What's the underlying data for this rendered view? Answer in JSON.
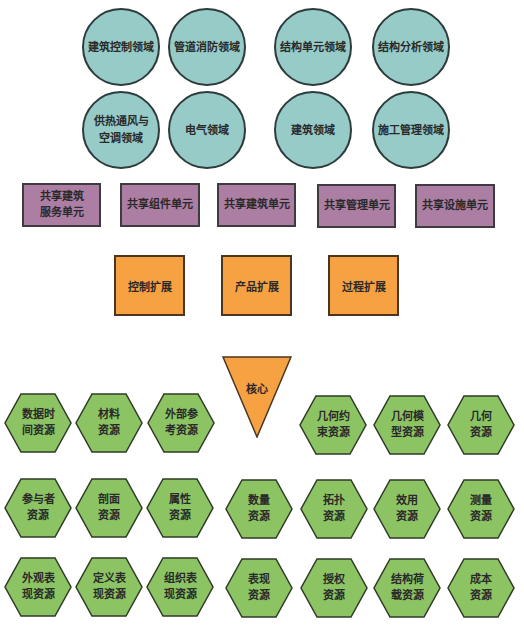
{
  "colors": {
    "domain_circle": "#97cbc8",
    "shared_unit_rect": "#ac7ea3",
    "extension_square": "#f6a142",
    "core_triangle": "#f6a142",
    "resource_hexagon": "#8cc464",
    "outline": "#333333"
  },
  "domain_layer": {
    "row1": [
      "建筑控制领域",
      "管道消防领域",
      "结构单元领域",
      "结构分析领域"
    ],
    "row2": [
      "供热通风与\n空调领域",
      "电气领域",
      "建筑领域",
      "施工管理领域"
    ]
  },
  "shared_layer": [
    "共享建筑\n服务单元",
    "共享组件单元",
    "共享建筑单元",
    "共享管理单元",
    "共享设施单元"
  ],
  "extension_layer": [
    "控制扩展",
    "产品扩展",
    "过程扩展"
  ],
  "core_layer": {
    "label": "核心"
  },
  "resource_layer": {
    "row1_left": [
      "数据时\n间资源",
      "材料\n资源",
      "外部参\n考资源"
    ],
    "row1_right": [
      "几何约\n束资源",
      "几何模\n型资源",
      "几何\n资源"
    ],
    "row2": [
      "参与者\n资源",
      "剖面\n资源",
      "属性\n资源",
      "数量\n资源",
      "拓扑\n资源",
      "效用\n资源",
      "测量\n资源"
    ],
    "row3": [
      "外观表\n现资源",
      "定义表\n现资源",
      "组织表\n现资源",
      "表现\n资源",
      "授权\n资源",
      "结构荷\n载资源",
      "成本\n资源"
    ]
  }
}
